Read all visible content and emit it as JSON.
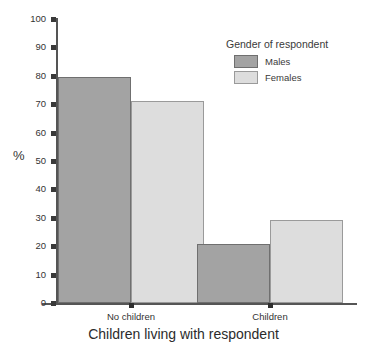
{
  "chart_data": {
    "type": "bar",
    "title": "",
    "xlabel": "Children living with respondent",
    "ylabel": "%",
    "categories": [
      "No children",
      "Children"
    ],
    "series": [
      {
        "name": "Males",
        "values": [
          79.5,
          20.7
        ],
        "color": "#a3a3a3"
      },
      {
        "name": "Females",
        "values": [
          71.0,
          29.3
        ],
        "color": "#dddddd"
      }
    ],
    "ylim": [
      0,
      100
    ],
    "yticks": [
      0,
      10,
      20,
      30,
      40,
      50,
      60,
      70,
      80,
      90,
      100
    ],
    "ytick_labels": [
      "0",
      "10",
      "20",
      "30",
      "40",
      "50",
      "60",
      "70",
      "80",
      "90",
      "100"
    ],
    "grid": false,
    "legend": {
      "title": "Gender of respondent",
      "position": "top-right",
      "entries": [
        "Males",
        "Females"
      ]
    }
  },
  "axes": {
    "y_title": "%",
    "x_title": "Children living with respondent"
  },
  "legend": {
    "title": "Gender of respondent",
    "items": [
      {
        "label": "Males"
      },
      {
        "label": "Females"
      }
    ]
  }
}
